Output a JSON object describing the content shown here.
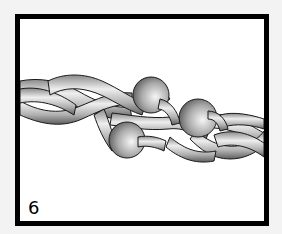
{
  "figure": {
    "step_number": "6",
    "colors": {
      "frame": "#000000",
      "background": "#f3f3f3",
      "panel": "#ffffff",
      "cord_light": "#e6e6e6",
      "cord_dark": "#6a6a6a",
      "bead_light": "#f2f2f2",
      "bead_dark": "#5a5a5a"
    },
    "beads": [
      {
        "name": "bead-top",
        "cx": 131,
        "cy": 76,
        "r": 18
      },
      {
        "name": "bead-right",
        "cx": 178,
        "cy": 99,
        "r": 19
      },
      {
        "name": "bead-bottom",
        "cx": 107,
        "cy": 121,
        "r": 18
      }
    ]
  }
}
